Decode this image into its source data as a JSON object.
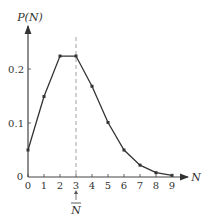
{
  "chart_data": {
    "type": "line",
    "title": "",
    "xlabel": "N",
    "ylabel": "P(N)",
    "x": [
      0,
      1,
      2,
      3,
      4,
      5,
      6,
      7,
      8,
      9
    ],
    "series": [
      {
        "name": "P(N)",
        "values": [
          0.05,
          0.149,
          0.224,
          0.224,
          0.168,
          0.101,
          0.05,
          0.022,
          0.008,
          0.003
        ]
      }
    ],
    "x_ticks": [
      "0",
      "1",
      "2",
      "3",
      "4",
      "5",
      "6",
      "7",
      "8",
      "9"
    ],
    "y_ticks": [
      "0",
      "0.1",
      "0.2"
    ],
    "xlim": [
      0,
      9.8
    ],
    "ylim": [
      0,
      0.28
    ],
    "grid": false,
    "legend": "none",
    "annotations": [
      {
        "type": "vertical-dashed-line",
        "x": 3,
        "label": "N̄",
        "arrow": "up"
      }
    ]
  },
  "labels": {
    "y_axis": "P(N)",
    "x_axis": "N",
    "mean_marker": "N",
    "y_tick_0": "0",
    "y_tick_1": "0.1",
    "y_tick_2": "0.2"
  },
  "colors": {
    "line": "#333333",
    "axis": "#444444",
    "dashed": "#999999"
  }
}
